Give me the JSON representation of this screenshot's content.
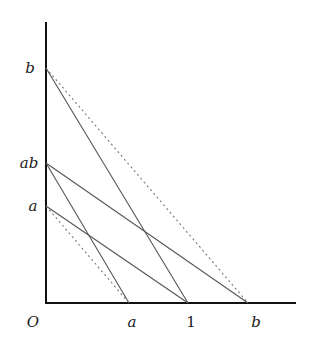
{
  "diagram": {
    "origin_label": "O",
    "x_axis": {
      "ticks": [
        {
          "label": "a",
          "px": 129
        },
        {
          "label": "1",
          "px": 188
        },
        {
          "label": "b",
          "px": 248
        }
      ]
    },
    "y_axis": {
      "ticks": [
        {
          "label": "b",
          "py": 68
        },
        {
          "label": "ab",
          "py": 163
        },
        {
          "label": "a",
          "py": 206
        }
      ]
    },
    "lines": [
      {
        "from": "b (y-axis)",
        "to": "1 (x-axis)",
        "style": "solid"
      },
      {
        "from": "b (y-axis)",
        "to": "b (x-axis)",
        "style": "dotted"
      },
      {
        "from": "ab (y-axis)",
        "to": "a (x-axis)",
        "style": "solid"
      },
      {
        "from": "ab (y-axis)",
        "to": "b (x-axis)",
        "style": "solid"
      },
      {
        "from": "a (y-axis)",
        "to": "1 (x-axis)",
        "style": "solid"
      },
      {
        "from": "a (y-axis)",
        "to": "a (x-axis)",
        "style": "dotted"
      }
    ],
    "colors": {
      "axis": "#111111",
      "line": "#555555",
      "dotted": "#777777"
    }
  }
}
